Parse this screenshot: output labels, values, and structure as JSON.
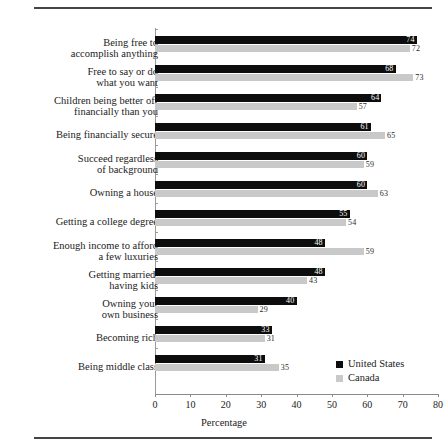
{
  "chart_data": {
    "type": "bar",
    "orientation": "horizontal",
    "title": "",
    "xlabel": "Percentage",
    "ylabel": "",
    "xlim": [
      0,
      80
    ],
    "xticks": [
      0,
      10,
      20,
      30,
      40,
      50,
      60,
      70,
      80
    ],
    "grid": false,
    "legend_position": "bottom-right",
    "categories": [
      "Being free to\naccomplish anything",
      "Free to say or do\nwhat you want",
      "Children being better off\nfinancially than you",
      "Being financially secure",
      "Succeed regardless\nof background",
      "Owning a house",
      "Getting a college degree",
      "Enough income to afford\na few luxuries",
      "Getting married,\nhaving kids",
      "Owning your\nown business",
      "Becoming rich",
      "Being middle class"
    ],
    "series": [
      {
        "name": "United States",
        "color": "#0d0d0d",
        "values": [
          74,
          68,
          64,
          61,
          60,
          60,
          55,
          48,
          48,
          40,
          33,
          31
        ]
      },
      {
        "name": "Canada",
        "color": "#c9c9c9",
        "values": [
          72,
          73,
          57,
          65,
          59,
          63,
          54,
          59,
          43,
          29,
          31,
          35
        ]
      }
    ]
  },
  "legend": {
    "items": [
      {
        "label": "United States",
        "swatch": "#0d0d0d"
      },
      {
        "label": "Canada",
        "swatch": "#c9c9c9"
      }
    ]
  }
}
